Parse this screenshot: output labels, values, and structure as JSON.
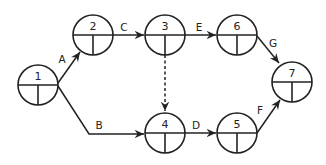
{
  "diagram": {
    "type": "activity-on-arrow network",
    "nodes": [
      {
        "id": "1",
        "label": "1",
        "cx": 38,
        "cy": 85
      },
      {
        "id": "2",
        "label": "2",
        "cx": 93,
        "cy": 35
      },
      {
        "id": "3",
        "label": "3",
        "cx": 165,
        "cy": 35
      },
      {
        "id": "4",
        "label": "4",
        "cx": 165,
        "cy": 133
      },
      {
        "id": "5",
        "label": "5",
        "cx": 237,
        "cy": 133
      },
      {
        "id": "6",
        "label": "6",
        "cx": 237,
        "cy": 35
      },
      {
        "id": "7",
        "label": "7",
        "cx": 292,
        "cy": 82
      }
    ],
    "edges": [
      {
        "from": "1",
        "to": "2",
        "label": "A",
        "dashed": false
      },
      {
        "from": "1",
        "to": "4",
        "label": "B",
        "dashed": false
      },
      {
        "from": "2",
        "to": "3",
        "label": "C",
        "dashed": false
      },
      {
        "from": "4",
        "to": "5",
        "label": "D",
        "dashed": false
      },
      {
        "from": "3",
        "to": "6",
        "label": "E",
        "dashed": false
      },
      {
        "from": "5",
        "to": "7",
        "label": "F",
        "dashed": false
      },
      {
        "from": "6",
        "to": "7",
        "label": "G",
        "dashed": false
      },
      {
        "from": "3",
        "to": "4",
        "label": "",
        "dashed": true
      }
    ],
    "colors": {
      "stroke": "#222222",
      "background": "#ffffff"
    }
  }
}
